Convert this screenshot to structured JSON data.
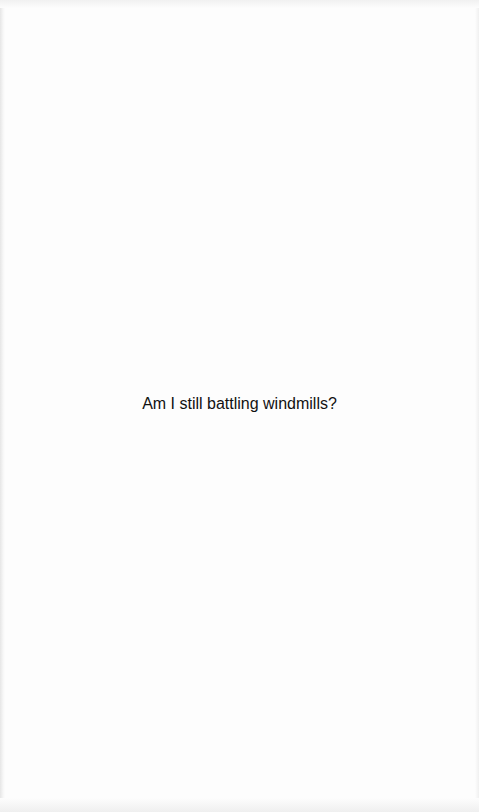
{
  "page": {
    "background_color": "#fdfdfd",
    "text_color": "#111111"
  },
  "content": {
    "message": "Am I still battling windmills?"
  }
}
